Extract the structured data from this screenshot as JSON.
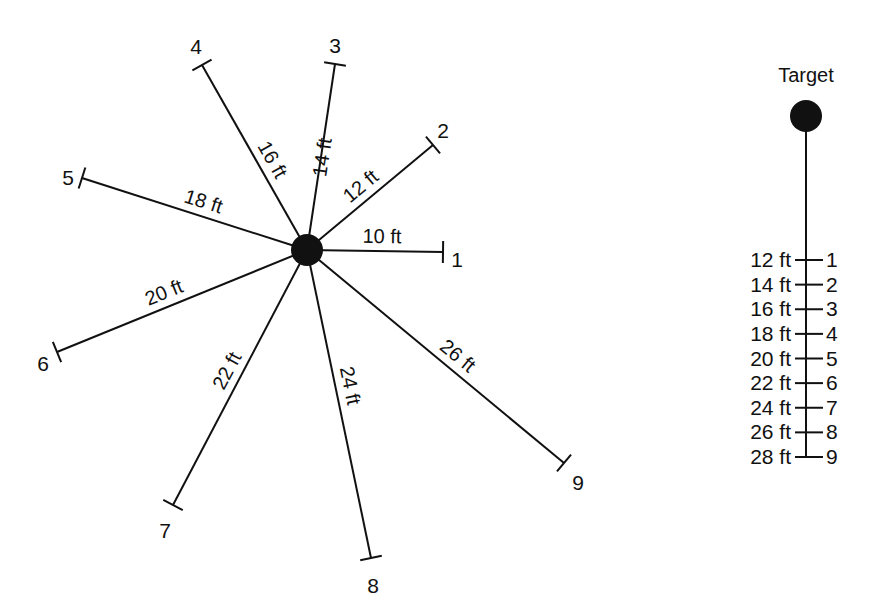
{
  "diagram": {
    "spoke_color": "#111111",
    "background": "#ffffff",
    "center_marker": "filled-circle",
    "spokes": [
      {
        "number": "1",
        "distance_label": "10 ft",
        "distance_ft": 10
      },
      {
        "number": "2",
        "distance_label": "12 ft",
        "distance_ft": 12
      },
      {
        "number": "3",
        "distance_label": "14 ft",
        "distance_ft": 14
      },
      {
        "number": "4",
        "distance_label": "16 ft",
        "distance_ft": 16
      },
      {
        "number": "5",
        "distance_label": "18 ft",
        "distance_ft": 18
      },
      {
        "number": "6",
        "distance_label": "20 ft",
        "distance_ft": 20
      },
      {
        "number": "7",
        "distance_label": "22 ft",
        "distance_ft": 22
      },
      {
        "number": "8",
        "distance_label": "24 ft",
        "distance_ft": 24
      },
      {
        "number": "9",
        "distance_label": "26 ft",
        "distance_ft": 26
      }
    ],
    "scale": {
      "title": "Target",
      "target_marker": "filled-circle",
      "ticks": [
        {
          "distance_label": "12 ft",
          "number": "1"
        },
        {
          "distance_label": "14 ft",
          "number": "2"
        },
        {
          "distance_label": "16 ft",
          "number": "3"
        },
        {
          "distance_label": "18 ft",
          "number": "4"
        },
        {
          "distance_label": "20 ft",
          "number": "5"
        },
        {
          "distance_label": "22 ft",
          "number": "6"
        },
        {
          "distance_label": "24 ft",
          "number": "7"
        },
        {
          "distance_label": "26 ft",
          "number": "8"
        },
        {
          "distance_label": "28 ft",
          "number": "9"
        }
      ]
    }
  }
}
